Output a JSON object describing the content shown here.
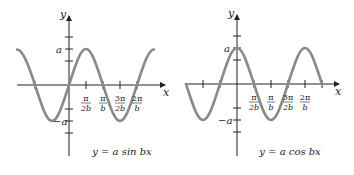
{
  "colors": {
    "curve": "#8a8a8a",
    "axis": "#222222",
    "text": "#222222"
  },
  "left_graph": {
    "caption": "y = a sin bx",
    "y_axis_label": "y",
    "x_axis_label": "x",
    "pos_label": "a",
    "neg_label": "−a",
    "ticks": [
      {
        "num": "π",
        "den": "2b"
      },
      {
        "num": "π",
        "den": "b"
      },
      {
        "num": "3π",
        "den": "2b"
      },
      {
        "num": "2π",
        "den": "b"
      }
    ]
  },
  "right_graph": {
    "caption": "y = a cos bx",
    "y_axis_label": "y",
    "x_axis_label": "x",
    "pos_label": "a",
    "neg_label": "−a",
    "ticks": [
      {
        "num": "π",
        "den": "2b"
      },
      {
        "num": "π",
        "den": "b"
      },
      {
        "num": "3π",
        "den": "2b"
      },
      {
        "num": "2π",
        "den": "b"
      }
    ]
  }
}
